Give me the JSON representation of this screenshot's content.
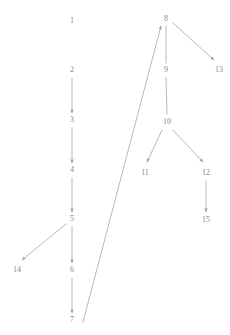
{
  "diagram": {
    "width": 230,
    "height": 335,
    "background_color": "#ffffff",
    "stroke_color": "#9a9a9a",
    "label_color": "#8a8a8a",
    "stroke_width": 0.7,
    "nodes": [
      {
        "id": "n1",
        "label": "1",
        "x": 72,
        "y": 21
      },
      {
        "id": "n2",
        "label": "2",
        "x": 72,
        "y": 70
      },
      {
        "id": "n3",
        "label": "3",
        "x": 72,
        "y": 120
      },
      {
        "id": "n4",
        "label": "4",
        "x": 72,
        "y": 170
      },
      {
        "id": "n5",
        "label": "5",
        "x": 72,
        "y": 219
      },
      {
        "id": "n6",
        "label": "6",
        "x": 72,
        "y": 270
      },
      {
        "id": "n7",
        "label": "7",
        "x": 72,
        "y": 320
      },
      {
        "id": "n8",
        "label": "8",
        "x": 166,
        "y": 19
      },
      {
        "id": "n9",
        "label": "9",
        "x": 166,
        "y": 70
      },
      {
        "id": "n10",
        "label": "10",
        "x": 167,
        "y": 122
      },
      {
        "id": "n11",
        "label": "11",
        "x": 145,
        "y": 173
      },
      {
        "id": "n12",
        "label": "12",
        "x": 206,
        "y": 173
      },
      {
        "id": "n13",
        "label": "13",
        "x": 219,
        "y": 70
      },
      {
        "id": "n14",
        "label": "14",
        "x": 17,
        "y": 270
      },
      {
        "id": "n15",
        "label": "15",
        "x": 206,
        "y": 220
      }
    ],
    "edges": [
      {
        "id": "e2-3",
        "from": "2",
        "to": "3",
        "x1": 72,
        "y1": 78,
        "x2": 72,
        "y2": 113,
        "arrow": true
      },
      {
        "id": "e3-4",
        "from": "3",
        "to": "4",
        "x1": 72,
        "y1": 128,
        "x2": 72,
        "y2": 163,
        "arrow": true
      },
      {
        "id": "e4-5",
        "from": "4",
        "to": "5",
        "x1": 72,
        "y1": 178,
        "x2": 72,
        "y2": 212,
        "arrow": true
      },
      {
        "id": "e5-6",
        "from": "5",
        "to": "6",
        "x1": 72,
        "y1": 227,
        "x2": 72,
        "y2": 263,
        "arrow": true
      },
      {
        "id": "e5-14",
        "from": "5",
        "to": "14",
        "x1": 66,
        "y1": 224,
        "x2": 22,
        "y2": 260,
        "arrow": true
      },
      {
        "id": "e6-7",
        "from": "6",
        "to": "7",
        "x1": 72,
        "y1": 278,
        "x2": 72,
        "y2": 313,
        "arrow": true
      },
      {
        "id": "e7-8",
        "from": "7",
        "to": "8",
        "x1": 83,
        "y1": 322,
        "x2": 161,
        "y2": 26,
        "arrow": true
      },
      {
        "id": "e8-9",
        "from": "8",
        "to": "9",
        "x1": 166,
        "y1": 26,
        "x2": 166,
        "y2": 63,
        "arrow": false
      },
      {
        "id": "e8-13",
        "from": "8",
        "to": "13",
        "x1": 173,
        "y1": 23,
        "x2": 214,
        "y2": 60,
        "arrow": true
      },
      {
        "id": "e9-10",
        "from": "9",
        "to": "10",
        "x1": 166,
        "y1": 78,
        "x2": 167,
        "y2": 114,
        "arrow": false
      },
      {
        "id": "e10-11",
        "from": "10",
        "to": "11",
        "x1": 162,
        "y1": 130,
        "x2": 147,
        "y2": 162,
        "arrow": true
      },
      {
        "id": "e10-12",
        "from": "10",
        "to": "12",
        "x1": 173,
        "y1": 130,
        "x2": 203,
        "y2": 162,
        "arrow": true
      },
      {
        "id": "e12-15",
        "from": "12",
        "to": "15",
        "x1": 206,
        "y1": 181,
        "x2": 206,
        "y2": 212,
        "arrow": true
      }
    ]
  }
}
